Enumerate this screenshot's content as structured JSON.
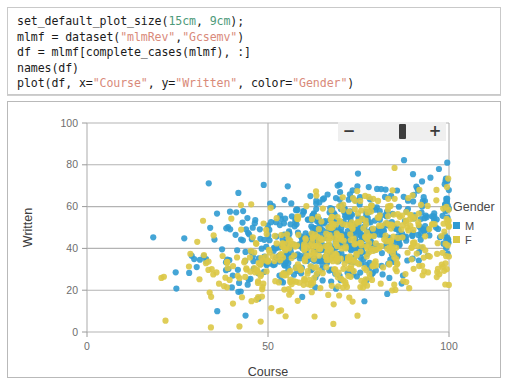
{
  "code_cell": {
    "lines": [
      [
        {
          "t": "set_default_plot_size(",
          "c": "plain"
        },
        {
          "t": "15cm",
          "c": "num"
        },
        {
          "t": ", ",
          "c": "plain"
        },
        {
          "t": "9cm",
          "c": "num"
        },
        {
          "t": ");",
          "c": "plain"
        }
      ],
      [
        {
          "t": "mlmf = dataset(",
          "c": "plain"
        },
        {
          "t": "\"mlmRev\"",
          "c": "str"
        },
        {
          "t": ",",
          "c": "plain"
        },
        {
          "t": "\"Gcsemv\"",
          "c": "str"
        },
        {
          "t": ")",
          "c": "plain"
        }
      ],
      [
        {
          "t": "df = mlmf[complete_cases(mlmf), :]",
          "c": "plain"
        }
      ],
      [
        {
          "t": "names(df)",
          "c": "plain"
        }
      ],
      [
        {
          "t": "plot(df, x=",
          "c": "plain"
        },
        {
          "t": "\"Course\"",
          "c": "str"
        },
        {
          "t": ", y=",
          "c": "plain"
        },
        {
          "t": "\"Written\"",
          "c": "str"
        },
        {
          "t": ", color=",
          "c": "plain"
        },
        {
          "t": "\"Gender\"",
          "c": "str"
        },
        {
          "t": ")",
          "c": "plain"
        }
      ]
    ],
    "plain_text": "set_default_plot_size(15cm, 9cm);\nmlmf = dataset(\"mlmRev\",\"Gcsemv\")\ndf = mlmf[complete_cases(mlmf), :]\nnames(df)\nplot(df, x=\"Course\", y=\"Written\", color=\"Gender\")"
  },
  "zoom_control": {
    "minus_label": "−",
    "plus_label": "+",
    "handle_position_percent": 50
  },
  "legend": {
    "title": "Gender",
    "entries": [
      {
        "label": "M",
        "color": "#309bd1"
      },
      {
        "label": "F",
        "color": "#dbc846"
      }
    ]
  },
  "colors": {
    "male": "#309bd1",
    "female": "#dbc846",
    "gridline": "#b3b3b3",
    "axis_text": "#6e6e6e",
    "axis_title": "#3d3d3d",
    "panel_border": "#b9b9b9",
    "code_border": "#c9c9c9",
    "string_token": "#d98a7a",
    "number_token": "#4e9a7a"
  },
  "chart_data": {
    "type": "scatter",
    "title": "",
    "xlabel": "Course",
    "ylabel": "Written",
    "xlim": [
      0,
      100
    ],
    "ylim": [
      0,
      100
    ],
    "xticks": [
      0,
      50,
      100
    ],
    "yticks": [
      0,
      20,
      40,
      60,
      80,
      100
    ],
    "xtick_labels": [
      "0",
      "50",
      "100"
    ],
    "ytick_labels": [
      "0",
      "20",
      "40",
      "60",
      "80",
      "100"
    ],
    "grid": true,
    "grid_axes": "both",
    "legend": {
      "title": "Gender",
      "position": "right"
    },
    "point_radius": 3.1,
    "point_opacity": 0.9,
    "series": [
      {
        "name": "M",
        "color": "#309bd1",
        "n_points": 580,
        "x_range": [
          11,
          100
        ],
        "y_range": [
          3,
          83
        ],
        "x_mean": 73,
        "y_mean": 47,
        "notes": "Males skew to higher Written scores; dense cluster from Course 55-100, Written 35-65",
        "seed": 1337
      },
      {
        "name": "F",
        "color": "#dbc846",
        "n_points": 520,
        "x_range": [
          18,
          100
        ],
        "y_range": [
          1,
          91
        ],
        "x_mean": 74,
        "y_mean": 41,
        "notes": "Females shifted slightly lower in Written; dense cluster Course 60-100, Written 25-60",
        "seed": 4242
      }
    ],
    "annotations": []
  }
}
